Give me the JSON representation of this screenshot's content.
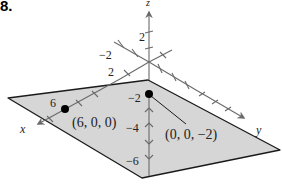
{
  "problem_number": "8.",
  "axes": {
    "x_label": "x",
    "y_label": "y",
    "z_label": "z"
  },
  "tick_labels": {
    "z_pos_2": "2",
    "y_neg_2": "−2",
    "x_pos_2": "2",
    "x_pos_6": "6",
    "z_neg_2": "−2",
    "z_neg_4": "−4",
    "z_neg_6": "−6"
  },
  "points": [
    {
      "label": "(6, 0, 0)",
      "coords": [
        6,
        0,
        0
      ]
    },
    {
      "label": "(0, 0, −2)",
      "coords": [
        0,
        0,
        -2
      ]
    }
  ],
  "colors": {
    "plane_fill": "#d6d6d6",
    "plane_edge": "#1a1a1a",
    "axis": "#6a6a6a",
    "point": "#000000"
  }
}
